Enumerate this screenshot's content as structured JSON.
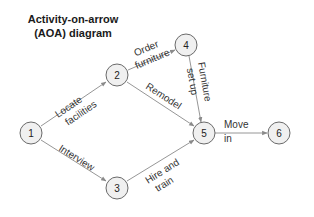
{
  "title": {
    "line1": "Activity-on-arrow",
    "line2": "(AOA) diagram"
  },
  "nodes": [
    {
      "id": "1",
      "label": "1",
      "x": 31,
      "y": 133
    },
    {
      "id": "2",
      "label": "2",
      "x": 117,
      "y": 75
    },
    {
      "id": "3",
      "label": "3",
      "x": 117,
      "y": 188
    },
    {
      "id": "4",
      "label": "4",
      "x": 186,
      "y": 45
    },
    {
      "id": "5",
      "label": "5",
      "x": 204,
      "y": 133
    },
    {
      "id": "6",
      "label": "6",
      "x": 279,
      "y": 133
    }
  ],
  "edges": [
    {
      "from": "1",
      "to": "2",
      "label_line1": "Locate",
      "label_line2": "facilities"
    },
    {
      "from": "1",
      "to": "3",
      "label_line1": "Interview",
      "label_line2": ""
    },
    {
      "from": "2",
      "to": "4",
      "label_line1": "Order",
      "label_line2": "furniture"
    },
    {
      "from": "2",
      "to": "5",
      "label_line1": "Remodel",
      "label_line2": ""
    },
    {
      "from": "3",
      "to": "5",
      "label_line1": "Hire and",
      "label_line2": "train"
    },
    {
      "from": "4",
      "to": "5",
      "label_line1": "Furniture",
      "label_line2": "set up"
    },
    {
      "from": "5",
      "to": "6",
      "label_line1": "Move",
      "label_line2": "in"
    }
  ],
  "colors": {
    "node_fill": "#f0f0f0",
    "node_stroke": "#6a6a6a",
    "edge": "#8a8a8a",
    "text": "#222222"
  }
}
